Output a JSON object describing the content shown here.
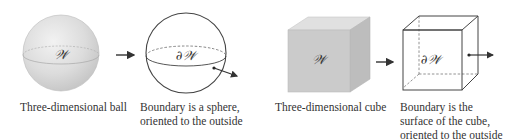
{
  "figures": [
    {
      "id": "ball",
      "symbol": "𝒲",
      "caption": "Three-dimensional ball"
    },
    {
      "id": "sphere",
      "symbol": "∂𝒲",
      "caption_lines": [
        "Boundary is a sphere,",
        "oriented to the outside"
      ]
    },
    {
      "id": "cube",
      "symbol": "𝒲",
      "caption": "Three-dimensional cube"
    },
    {
      "id": "cube-surface",
      "symbol": "∂𝒲",
      "caption_lines": [
        "Boundary is the",
        "surface of the cube,",
        "oriented to the outside"
      ]
    }
  ],
  "colors": {
    "solid_fill": "#d4d4d4",
    "cube_front": "#c9c9c9",
    "cube_top": "#dedede",
    "cube_side": "#b9b9b9",
    "stroke": "#444444"
  }
}
